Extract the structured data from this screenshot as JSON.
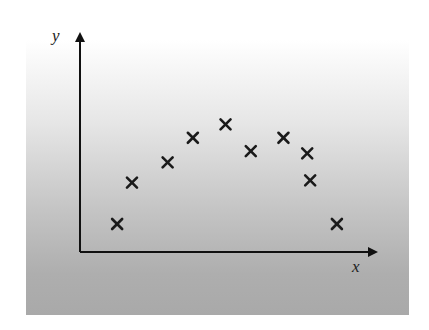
{
  "chart_data": {
    "type": "scatter",
    "title": "",
    "xlabel": "x",
    "ylabel": "y",
    "marker": "x",
    "grid": false,
    "legend": null,
    "tick_labels": {
      "x": [],
      "y": []
    },
    "xlim": [
      0,
      10
    ],
    "ylim": [
      0,
      10
    ],
    "points": [
      {
        "x": 1.25,
        "y": 1.25
      },
      {
        "x": 1.75,
        "y": 3.1
      },
      {
        "x": 2.95,
        "y": 4.0
      },
      {
        "x": 3.8,
        "y": 5.1
      },
      {
        "x": 4.9,
        "y": 5.7
      },
      {
        "x": 5.75,
        "y": 4.5
      },
      {
        "x": 6.85,
        "y": 5.1
      },
      {
        "x": 7.65,
        "y": 4.4
      },
      {
        "x": 7.75,
        "y": 3.2
      },
      {
        "x": 8.65,
        "y": 1.25
      }
    ]
  },
  "colors": {
    "axis": "#111111",
    "marker": "#1a1a1a",
    "background_top": "#ffffff",
    "background_bottom": "#a9a9a9"
  },
  "labels": {
    "x_axis": "x",
    "y_axis": "y"
  }
}
